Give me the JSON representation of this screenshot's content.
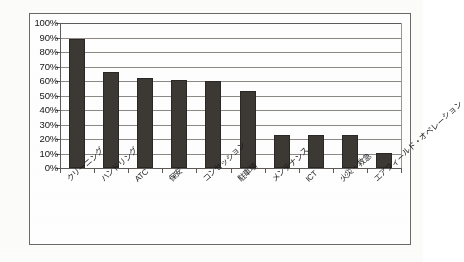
{
  "chart_data": {
    "type": "bar",
    "title": "",
    "subtitle": "",
    "xlabel": "",
    "ylabel": "",
    "ylim": [
      0,
      100
    ],
    "y_unit": "%",
    "grid": true,
    "legend": "none",
    "orientation": "vertical",
    "categories": [
      "クリーニング",
      "ハンドリング",
      "ATC",
      "保安",
      "コンセッション",
      "駐車場",
      "メンテナンス",
      "ICT",
      "火災・救急",
      "エアフィールド・オペレーション"
    ],
    "values": [
      89,
      66,
      62,
      61,
      60,
      53,
      23,
      23,
      23,
      10
    ],
    "ytick_labels": [
      "100%",
      "90%",
      "80%",
      "70%",
      "60%",
      "50%",
      "40%",
      "30%",
      "20%",
      "10%",
      "0%"
    ],
    "ytick_values": [
      100,
      90,
      80,
      70,
      60,
      50,
      40,
      30,
      20,
      10,
      0
    ],
    "series": [
      {
        "name": "",
        "values": [
          89,
          66,
          62,
          61,
          60,
          53,
          23,
          23,
          23,
          10
        ]
      }
    ],
    "colors": {
      "bar": "#3c3834",
      "bar_edge": "#2a2724",
      "gridline": "#8d8a86",
      "axis": "#5d5a57",
      "frame": "#6d6a66",
      "background": "#ffffff",
      "text": "#161616"
    }
  }
}
